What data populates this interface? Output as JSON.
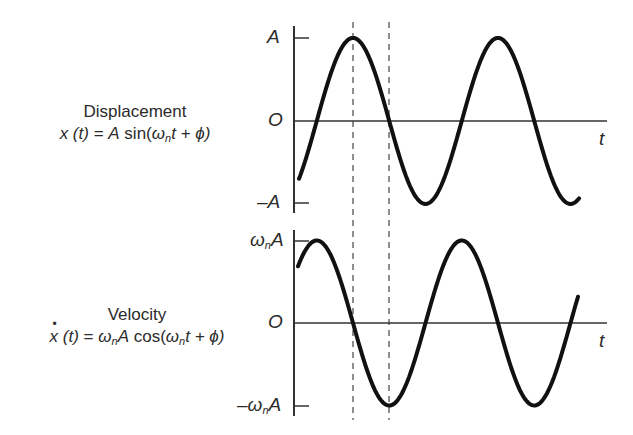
{
  "panels": [
    {
      "title": "Displacement",
      "equation": {
        "lhs": "x (t)",
        "eq": " = ",
        "amp": "A",
        "func": " sin(",
        "omega": "ω",
        "sub": "n",
        "rest": "t + ϕ)"
      },
      "y_ticks": {
        "top": "A",
        "zero": "O",
        "bottom": "–A"
      },
      "axis_label": "t"
    },
    {
      "title": "Velocity",
      "equation": {
        "lhs": "x",
        "lhs2": " (t)",
        "eq": " = ",
        "omega1": "ω",
        "sub1": "n",
        "amp": "A",
        "func": " cos(",
        "omega": "ω",
        "sub": "n",
        "rest": "t + ϕ)"
      },
      "y_ticks": {
        "top_omega": "ω",
        "top_sub": "n",
        "top_amp": "A",
        "zero": "O",
        "bottom_sign": "–",
        "bottom_omega": "ω",
        "bottom_sub": "n",
        "bottom_amp": "A"
      },
      "axis_label": "t"
    }
  ],
  "chart_data": [
    {
      "type": "line",
      "title": "Displacement x(t) = A sin(ωn t + ϕ)",
      "xlabel": "t",
      "ylabel": "",
      "ytick_labels": [
        "A",
        "O",
        "–A"
      ],
      "ylim": [
        -1,
        1
      ],
      "series": [
        {
          "name": "x(t)",
          "function": "A sin(ωn t + ϕ)",
          "cycles_shown": 1.9,
          "x": [
            0.0,
            0.12,
            0.37,
            0.62,
            0.87,
            1.12,
            1.37,
            1.62,
            1.87,
            1.91
          ],
          "values": [
            -0.72,
            0,
            1,
            0,
            -1,
            0,
            1,
            0,
            -1,
            -0.94
          ]
        }
      ],
      "reference_lines": [
        {
          "type": "vertical-dashed",
          "at": "peak of x(t)"
        },
        {
          "type": "vertical-dashed",
          "at": "zero crossing of x(t)"
        }
      ]
    },
    {
      "type": "line",
      "title": "Velocity ẋ(t) = ωn A cos(ωn t + ϕ)",
      "xlabel": "t",
      "ylabel": "",
      "ytick_labels": [
        "ωnA",
        "O",
        "–ωnA"
      ],
      "ylim": [
        -1,
        1
      ],
      "series": [
        {
          "name": "ẋ(t)",
          "function": "ωn A cos(ωn t + ϕ)",
          "cycles_shown": 1.9,
          "x": [
            0.0,
            0.12,
            0.37,
            0.62,
            0.87,
            1.12,
            1.37,
            1.62,
            1.87,
            1.91
          ],
          "values": [
            0.74,
            1,
            0,
            -1,
            0,
            1,
            0,
            -1,
            0,
            0.31
          ]
        }
      ],
      "reference_lines": [
        {
          "type": "vertical-dashed",
          "at": "zero crossing of ẋ(t)"
        },
        {
          "type": "vertical-dashed",
          "at": "trough of ẋ(t)"
        }
      ]
    }
  ]
}
